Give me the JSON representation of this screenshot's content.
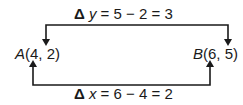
{
  "diagram": {
    "point_a": {
      "letter": "A",
      "coords": "(4, 2)"
    },
    "point_b": {
      "letter": "B",
      "coords": "(6, 5)"
    },
    "delta_y": {
      "symbol": "Δ",
      "var": "y",
      "expr": " = 5 − 2 = 3"
    },
    "delta_x": {
      "symbol": "Δ",
      "var": "x",
      "expr": " = 6 − 4 = 2"
    },
    "line_color": "#1a1a1a"
  }
}
